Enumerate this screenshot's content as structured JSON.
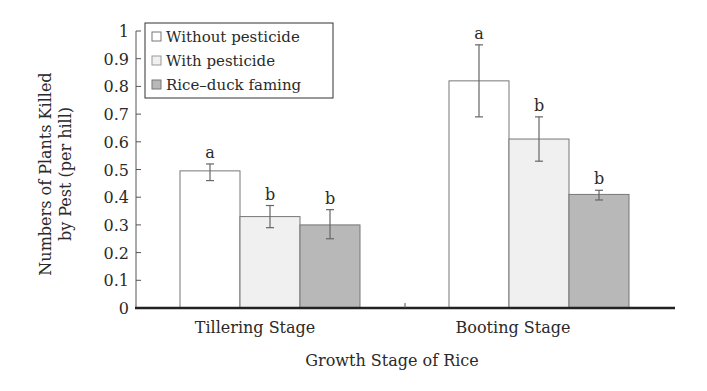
{
  "chart_data": {
    "type": "bar",
    "title": "",
    "xlabel": "Growth Stage of Rice",
    "ylabel_lines": [
      "Numbers of Plants Killed",
      "by Pest (per hill)"
    ],
    "ylabel": "Numbers of Plants Killed by Pest (per hill)",
    "ylim": [
      0,
      1
    ],
    "yticks": [
      "0",
      "0.1",
      "0.2",
      "0.3",
      "0.4",
      "0.5",
      "0.6",
      "0.7",
      "0.8",
      "0.9",
      "1"
    ],
    "grid": false,
    "legend_position": "upper-left-inside",
    "categories": [
      "Tillering Stage",
      "Booting Stage"
    ],
    "series": [
      {
        "name": "Without pesticide",
        "fill": "#ffffff",
        "values": [
          0.495,
          0.82
        ],
        "error_low": [
          0.46,
          0.69
        ],
        "error_high": [
          0.52,
          0.95
        ],
        "significance": [
          "a",
          "a"
        ]
      },
      {
        "name": "With pesticide",
        "fill": "#f0f0f0",
        "values": [
          0.33,
          0.61
        ],
        "error_low": [
          0.29,
          0.53
        ],
        "error_high": [
          0.37,
          0.69
        ],
        "significance": [
          "b",
          "b"
        ]
      },
      {
        "name": "Rice–duck faming",
        "fill": "#b8b8b8",
        "values": [
          0.3,
          0.41
        ],
        "error_low": [
          0.25,
          0.39
        ],
        "error_high": [
          0.355,
          0.425
        ],
        "significance": [
          "b",
          "b"
        ]
      }
    ]
  },
  "colors": {
    "axis": "#222222",
    "bar_border": "#777777",
    "error_bar": "#666666",
    "text": "#2a2a2a"
  }
}
